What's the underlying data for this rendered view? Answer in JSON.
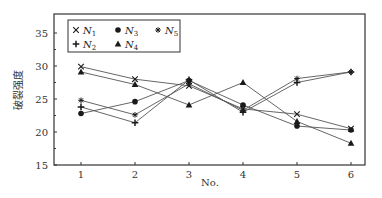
{
  "chart_data": {
    "type": "line",
    "title": "",
    "xlabel": "No.",
    "ylabel": "破裂强度",
    "x": [
      1,
      2,
      3,
      4,
      5,
      6
    ],
    "xticks": [
      "1",
      "2",
      "3",
      "4",
      "5",
      "6"
    ],
    "yticks": [
      "15",
      "20",
      "25",
      "30",
      "35"
    ],
    "xlim": [
      0.55,
      6.3
    ],
    "ylim": [
      15,
      37.5
    ],
    "grid": false,
    "legend_position": "upper left",
    "series": [
      {
        "name": "N1",
        "marker": "x",
        "values": [
          29.9,
          28.0,
          27.0,
          23.5,
          22.7,
          20.5
        ]
      },
      {
        "name": "N2",
        "marker": "plus",
        "values": [
          23.8,
          21.4,
          27.9,
          23.0,
          27.5,
          29.1
        ]
      },
      {
        "name": "N3",
        "marker": "circle",
        "values": [
          22.8,
          24.6,
          27.8,
          24.1,
          20.9,
          20.3
        ]
      },
      {
        "name": "N4",
        "marker": "triangle",
        "values": [
          29.1,
          27.2,
          24.1,
          27.5,
          21.6,
          18.3
        ]
      },
      {
        "name": "N5",
        "marker": "star",
        "values": [
          24.8,
          22.6,
          27.3,
          23.3,
          28.1,
          29.1
        ]
      }
    ],
    "legend": [
      {
        "label": "N",
        "sub": "1",
        "marker": "x"
      },
      {
        "label": "N",
        "sub": "3",
        "marker": "circle"
      },
      {
        "label": "N",
        "sub": "5",
        "marker": "star"
      },
      {
        "label": "N",
        "sub": "2",
        "marker": "plus"
      },
      {
        "label": "N",
        "sub": "4",
        "marker": "triangle"
      }
    ],
    "colors": {
      "line": "#555555",
      "marker": "#1a1a1a",
      "axis": "#333333"
    }
  }
}
